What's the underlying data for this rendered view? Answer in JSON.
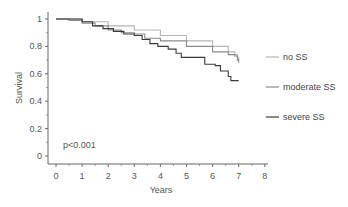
{
  "chart_data": {
    "type": "line",
    "title": "",
    "xlabel": "Years",
    "ylabel": "Survival",
    "xlim": [
      0,
      8
    ],
    "ylim": [
      0,
      1
    ],
    "x_ticks": [
      "0",
      "1",
      "2",
      "3",
      "4",
      "5",
      "6",
      "7",
      "8"
    ],
    "y_ticks": [
      "0",
      "0.2",
      "0.4",
      "0.6",
      "0.8",
      "1"
    ],
    "grid": false,
    "legend_position": "right",
    "annotation": "p<0.001",
    "series": [
      {
        "name": "no SS",
        "color": "#b5b5b5",
        "points": [
          [
            0,
            1.0
          ],
          [
            0.5,
            1.0
          ],
          [
            1,
            0.98
          ],
          [
            2,
            0.95
          ],
          [
            3,
            0.92
          ],
          [
            4,
            0.88
          ],
          [
            5,
            0.84
          ],
          [
            6,
            0.8
          ],
          [
            6.6,
            0.76
          ],
          [
            6.85,
            0.74
          ],
          [
            6.95,
            0.72
          ],
          [
            7.0,
            0.7
          ]
        ]
      },
      {
        "name": "moderate SS",
        "color": "#8a8a8a",
        "points": [
          [
            0,
            1.0
          ],
          [
            0.5,
            0.99
          ],
          [
            1,
            0.97
          ],
          [
            1.5,
            0.95
          ],
          [
            2,
            0.92
          ],
          [
            2.5,
            0.9
          ],
          [
            3,
            0.89
          ],
          [
            3.4,
            0.86
          ],
          [
            4,
            0.84
          ],
          [
            5,
            0.8
          ],
          [
            6,
            0.76
          ],
          [
            6.6,
            0.74
          ],
          [
            6.85,
            0.73
          ],
          [
            6.95,
            0.7
          ],
          [
            7.0,
            0.68
          ]
        ]
      },
      {
        "name": "severe SS",
        "color": "#3a3a3a",
        "points": [
          [
            0,
            1.0
          ],
          [
            0.8,
            1.0
          ],
          [
            1.0,
            0.98
          ],
          [
            1.4,
            0.95
          ],
          [
            1.8,
            0.93
          ],
          [
            2.2,
            0.91
          ],
          [
            2.6,
            0.89
          ],
          [
            3.0,
            0.88
          ],
          [
            3.3,
            0.85
          ],
          [
            3.6,
            0.82
          ],
          [
            3.9,
            0.8
          ],
          [
            4.3,
            0.78
          ],
          [
            4.6,
            0.75
          ],
          [
            4.8,
            0.72
          ],
          [
            5.5,
            0.72
          ],
          [
            5.7,
            0.67
          ],
          [
            6.1,
            0.66
          ],
          [
            6.3,
            0.62
          ],
          [
            6.6,
            0.58
          ],
          [
            6.7,
            0.55
          ],
          [
            7.0,
            0.55
          ]
        ]
      }
    ]
  }
}
